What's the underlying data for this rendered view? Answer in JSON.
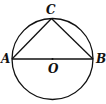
{
  "diagram": {
    "points": {
      "A": {
        "label": "A"
      },
      "B": {
        "label": "B"
      },
      "C": {
        "label": "C"
      },
      "O": {
        "label": "O"
      }
    },
    "segments": [
      "AB",
      "AC",
      "BC"
    ],
    "circle": {
      "center": "O",
      "diameter": "AB"
    },
    "colors": {
      "stroke": "#111111",
      "background": "#ffffff"
    }
  }
}
